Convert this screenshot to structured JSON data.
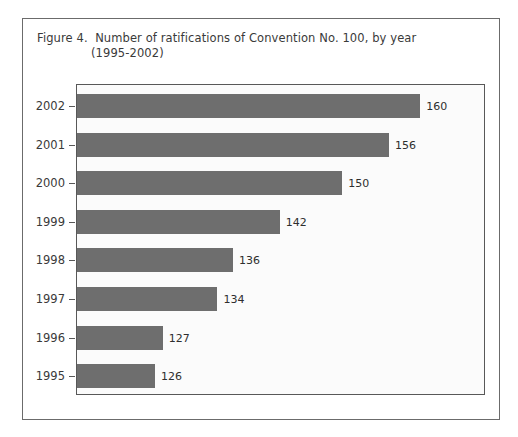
{
  "figure": {
    "caption_line_1": "Figure 4.  Number of ratifications of Convention No. 100, by year",
    "caption_line_2": "(1995-2002)"
  },
  "chart_data": {
    "type": "bar",
    "orientation": "horizontal",
    "title": "Figure 4.  Number of ratifications of Convention No. 100, by year (1995-2002)",
    "xlabel": "",
    "ylabel": "",
    "categories": [
      "2002",
      "2001",
      "2000",
      "1999",
      "1998",
      "1997",
      "1996",
      "1995"
    ],
    "values": [
      160,
      156,
      150,
      142,
      136,
      134,
      127,
      126
    ],
    "value_labels": [
      "160",
      "156",
      "150",
      "142",
      "136",
      "134",
      "127",
      "126"
    ],
    "axis_baseline": 116,
    "xlim": [
      116,
      166
    ],
    "grid": false,
    "legend": null,
    "bar_color": "#6e6e6e",
    "plot_background": "#fbfbfb",
    "frame_color": "#585858"
  }
}
